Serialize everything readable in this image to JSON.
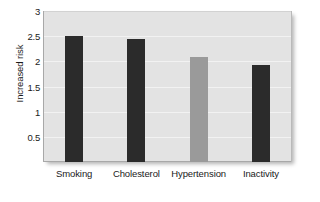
{
  "chart_data": {
    "type": "bar",
    "title": "",
    "subtitle": "",
    "xlabel": "",
    "ylabel": "Increased risk",
    "categories": [
      "Smoking",
      "Cholesterol",
      "Hypertension",
      "Inactivity"
    ],
    "values": [
      2.5,
      2.44,
      2.08,
      1.92
    ],
    "bar_colors": [
      "#2b2b2b",
      "#2b2b2b",
      "#9a9a9a",
      "#2b2b2b"
    ],
    "ylim": [
      0,
      3
    ],
    "yticks": [
      3,
      2.5,
      2,
      1.5,
      1,
      0.5
    ],
    "ytick_labels": [
      "3",
      "2.5",
      "2",
      "1.5",
      "1",
      "0.5"
    ],
    "grid": true,
    "grid_axis": "y",
    "legend": false,
    "legend_position": "none",
    "plot_background": "#e3e3e3",
    "figure_background": "#ffffff",
    "text_color": "#1a1a1a"
  }
}
